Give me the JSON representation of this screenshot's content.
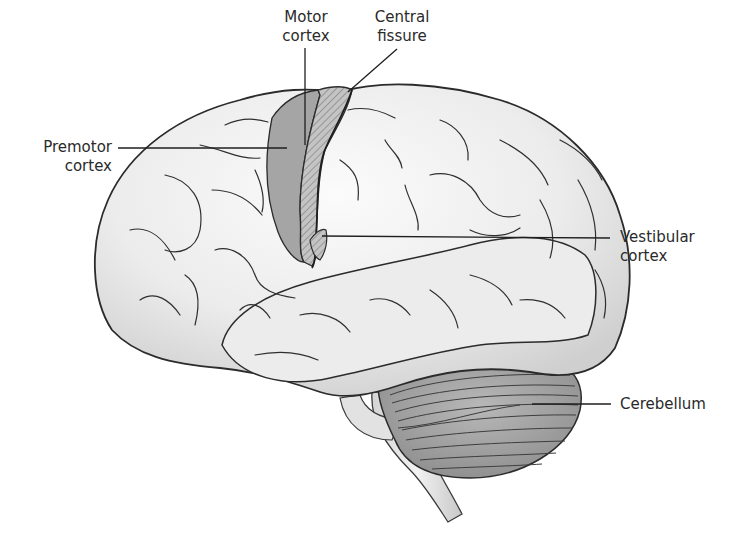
{
  "figure": {
    "type": "labeled anatomical illustration",
    "colors": {
      "background": "#ffffff",
      "brain_fill": "#e9e9e9",
      "brain_highlight": "#f8f8f8",
      "outline": "#2b2b2b",
      "premotor_fill": "#a8a8a8",
      "motor_fill": "#b9b9b9",
      "cerebellum_fill": "#9a9a9a",
      "label_text": "#2a2a2a"
    }
  },
  "labels": {
    "motor_cortex": {
      "line1": "Motor",
      "line2": "cortex"
    },
    "central_fissure": {
      "line1": "Central",
      "line2": "fissure"
    },
    "premotor_cortex": {
      "line1": "Premotor",
      "line2": "cortex"
    },
    "vestibular_cortex": {
      "line1": "Vestibular",
      "line2": "cortex"
    },
    "cerebellum": {
      "line1": "Cerebellum"
    }
  }
}
